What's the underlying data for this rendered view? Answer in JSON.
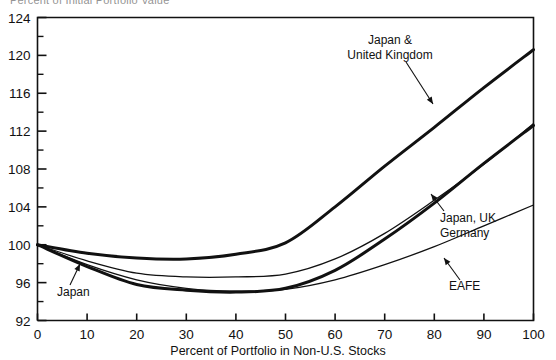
{
  "cropped_title": "Percent of Initial Portfolio Value",
  "chart_data": {
    "type": "line",
    "title": "",
    "xlabel": "Percent of Portfolio in Non-U.S. Stocks",
    "ylabel": "",
    "xlim": [
      0,
      100
    ],
    "ylim": [
      92,
      124
    ],
    "grid": false,
    "legend_position": "inline-annotations",
    "x_ticks": [
      0,
      10,
      20,
      30,
      40,
      50,
      60,
      70,
      80,
      90,
      100
    ],
    "y_ticks": [
      92,
      96,
      100,
      104,
      108,
      112,
      116,
      120,
      124
    ],
    "y_minor_ticks": [
      94,
      98,
      102,
      106,
      110,
      114,
      118,
      122
    ],
    "x": [
      0,
      10,
      20,
      30,
      40,
      50,
      60,
      70,
      80,
      90,
      100
    ],
    "series": [
      {
        "name": "Japan & United Kingdom",
        "width": "thick",
        "values": [
          100.0,
          99.1,
          98.6,
          98.5,
          99.0,
          100.2,
          104.0,
          108.3,
          112.4,
          116.6,
          120.6
        ]
      },
      {
        "name": "Japan, UK Germany",
        "width": "thick",
        "values": [
          100.0,
          97.7,
          95.8,
          95.2,
          95.0,
          95.4,
          97.3,
          100.6,
          104.4,
          108.6,
          112.6
        ]
      },
      {
        "name": "Japan",
        "width": "thin",
        "values": [
          100.0,
          98.3,
          97.0,
          96.6,
          96.6,
          96.9,
          98.5,
          101.2,
          104.7,
          108.5,
          112.8
        ]
      },
      {
        "name": "EAFE",
        "width": "thin",
        "values": [
          100.0,
          97.9,
          96.3,
          95.4,
          95.1,
          95.3,
          96.3,
          97.9,
          99.8,
          102.0,
          104.2
        ]
      }
    ],
    "annotations": [
      {
        "text_lines": [
          "Japan &",
          "United Kingdom"
        ],
        "name": "japan-uk"
      },
      {
        "text_lines": [
          "Japan, UK",
          "Germany"
        ],
        "name": "japan-uk-germany"
      },
      {
        "text_lines": [
          "EAFE"
        ],
        "name": "eafe"
      },
      {
        "text_lines": [
          "Japan"
        ],
        "name": "japan"
      }
    ]
  }
}
